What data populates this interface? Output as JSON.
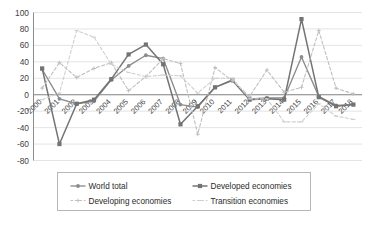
{
  "chart_data": {
    "type": "line",
    "title": "",
    "subtitle": "",
    "xlabel": "",
    "ylabel": "",
    "categories": [
      "2000",
      "2001",
      "2002",
      "2003",
      "2004",
      "2005",
      "2006",
      "2007",
      "2008",
      "2009",
      "2010",
      "2011",
      "2012",
      "2013",
      "2014",
      "2015",
      "2016",
      "2017",
      "2018"
    ],
    "x": [
      2000,
      2001,
      2002,
      2003,
      2004,
      2005,
      2006,
      2007,
      2008,
      2009,
      2010,
      2011,
      2012,
      2013,
      2014,
      2015,
      2016,
      2017,
      2018
    ],
    "ylim": [
      -80,
      100
    ],
    "ytick_labels": [
      "100",
      "80",
      "60",
      "40",
      "20",
      "0",
      "-20",
      "-40",
      "-60",
      "-80"
    ],
    "yticks": [
      100,
      80,
      60,
      40,
      20,
      0,
      -20,
      -40,
      -60,
      -80
    ],
    "grid": true,
    "legend_position": "bottom",
    "series": [
      {
        "name": "World total",
        "color": "#8c8c8c",
        "dash": "solid",
        "marker": "circle",
        "values": [
          31,
          -5,
          -11,
          -8,
          18,
          35,
          48,
          44,
          -12,
          -15,
          9,
          17,
          -5,
          -4,
          -4,
          46,
          -2,
          -13,
          -12
        ]
      },
      {
        "name": "Developed economies",
        "color": "#737373",
        "dash": "solid",
        "marker": "square",
        "values": [
          32,
          -60,
          -11,
          -6,
          19,
          49,
          61,
          37,
          -36,
          -14,
          9,
          18,
          -6,
          -5,
          -6,
          92,
          -3,
          -14,
          -12
        ]
      },
      {
        "name": "Developing economies",
        "color": "#bfbfbf",
        "dash": "dashed",
        "marker": "plus",
        "values": [
          8,
          39,
          21,
          32,
          39,
          5,
          22,
          44,
          38,
          -48,
          33,
          17,
          -2,
          30,
          3,
          9,
          78,
          8,
          1
        ]
      },
      {
        "name": "Transition economies",
        "color": "#cfcfcf",
        "dash": "dashed",
        "marker": "dash",
        "values": [
          -6,
          2,
          78,
          70,
          37,
          27,
          22,
          24,
          23,
          2,
          20,
          20,
          -5,
          -5,
          -33,
          -33,
          -11,
          -26,
          -30
        ]
      }
    ]
  },
  "legend": {
    "items": [
      {
        "label": "World total"
      },
      {
        "label": "Developed economies"
      },
      {
        "label": "Developing economies"
      },
      {
        "label": "Transition economies"
      }
    ]
  }
}
